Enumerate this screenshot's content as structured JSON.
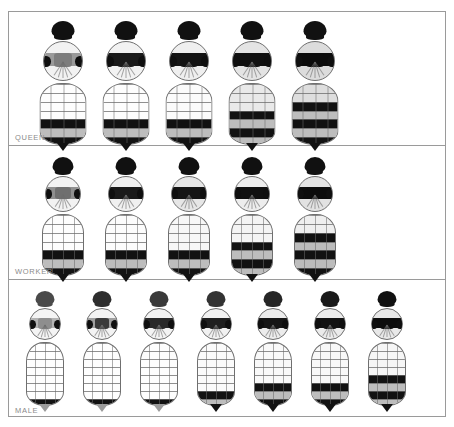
{
  "figure": {
    "panel_count": 3,
    "frame_color": "#9a9a9a",
    "background": "#ffffff"
  },
  "panels": [
    {
      "id": "queen-panel",
      "label": "QUEEN",
      "specimen_count": 5,
      "abdomen_form": "broad-ovate",
      "specimens": [
        {
          "index": 1,
          "head": "#111111",
          "thorax_base": "#f2f2f2",
          "thorax_band": "#9a9a9a",
          "scutellum": "#7d7d7d",
          "abdomen_tone": "#fdfdfd",
          "dark_bands": 3,
          "label": "queen-1"
        },
        {
          "index": 2,
          "head": "#111111",
          "thorax_base": "#f2f2f2",
          "thorax_band": "#1a1a1a",
          "scutellum": "#1a1a1a",
          "abdomen_tone": "#fdfdfd",
          "dark_bands": 3,
          "label": "queen-2"
        },
        {
          "index": 3,
          "head": "#111111",
          "thorax_base": "#efefef",
          "thorax_band": "#141414",
          "scutellum": "#141414",
          "abdomen_tone": "#fbfbfb",
          "dark_bands": 3,
          "label": "queen-3"
        },
        {
          "index": 4,
          "head": "#111111",
          "thorax_base": "#e4e4e4",
          "thorax_band": "#101010",
          "scutellum": "#101010",
          "abdomen_tone": "#e9e9e9",
          "dark_bands": 4,
          "label": "queen-4"
        },
        {
          "index": 5,
          "head": "#111111",
          "thorax_base": "#dcdcdc",
          "thorax_band": "#0c0c0c",
          "scutellum": "#0c0c0c",
          "abdomen_tone": "#dedede",
          "dark_bands": 5,
          "label": "queen-5"
        }
      ]
    },
    {
      "id": "worker-panel",
      "label": "WORKER",
      "specimen_count": 5,
      "abdomen_form": "narrow-elongate",
      "specimens": [
        {
          "index": 1,
          "head": "#111111",
          "thorax_base": "#f2f2f2",
          "thorax_band": "#8f8f8f",
          "scutellum": "#6f6f6f",
          "abdomen_tone": "#fdfdfd",
          "dark_bands": 3,
          "label": "worker-1"
        },
        {
          "index": 2,
          "head": "#111111",
          "thorax_base": "#f0f0f0",
          "thorax_band": "#1a1a1a",
          "scutellum": "#1a1a1a",
          "abdomen_tone": "#fcfcfc",
          "dark_bands": 3,
          "label": "worker-2"
        },
        {
          "index": 3,
          "head": "#111111",
          "thorax_base": "#e6e6e6",
          "thorax_band": "#151515",
          "scutellum": "#151515",
          "abdomen_tone": "#f7f7f7",
          "dark_bands": 3,
          "label": "worker-3"
        },
        {
          "index": 4,
          "head": "#111111",
          "thorax_base": "#ededed",
          "thorax_band": "#101010",
          "scutellum": "#101010",
          "abdomen_tone": "#f4f4f4",
          "dark_bands": 4,
          "label": "worker-4"
        },
        {
          "index": 5,
          "head": "#111111",
          "thorax_base": "#e2e2e2",
          "thorax_band": "#0c0c0c",
          "scutellum": "#0c0c0c",
          "abdomen_tone": "#efefef",
          "dark_bands": 5,
          "label": "worker-5"
        }
      ]
    },
    {
      "id": "male-panel",
      "label": "MALE",
      "specimen_count": 7,
      "abdomen_form": "slender-tapered",
      "specimens": [
        {
          "index": 1,
          "head": "#4a4a4a",
          "thorax_base": "#f4f4f4",
          "thorax_band": "#b4b4b4",
          "scutellum": "#8e8e8e",
          "abdomen_tone": "#fefefe",
          "dark_bands": 1,
          "label": "male-1"
        },
        {
          "index": 2,
          "head": "#2e2e2e",
          "thorax_base": "#f3f3f3",
          "thorax_band": "#a0a0a0",
          "scutellum": "#3a3a3a",
          "abdomen_tone": "#fefefe",
          "dark_bands": 1,
          "label": "male-2"
        },
        {
          "index": 3,
          "head": "#3a3a3a",
          "thorax_base": "#f3f3f3",
          "thorax_band": "#2a2a2a",
          "scutellum": "#2a2a2a",
          "abdomen_tone": "#fdfdfd",
          "dark_bands": 1,
          "label": "male-3"
        },
        {
          "index": 4,
          "head": "#333333",
          "thorax_base": "#f1f1f1",
          "thorax_band": "#1f1f1f",
          "scutellum": "#1f1f1f",
          "abdomen_tone": "#fbfbfb",
          "dark_bands": 2,
          "label": "male-4"
        },
        {
          "index": 5,
          "head": "#262626",
          "thorax_base": "#ececec",
          "thorax_band": "#161616",
          "scutellum": "#161616",
          "abdomen_tone": "#f9f9f9",
          "dark_bands": 3,
          "label": "male-5"
        },
        {
          "index": 6,
          "head": "#1a1a1a",
          "thorax_base": "#ebebeb",
          "thorax_band": "#121212",
          "scutellum": "#121212",
          "abdomen_tone": "#f8f8f8",
          "dark_bands": 3,
          "label": "male-6"
        },
        {
          "index": 7,
          "head": "#111111",
          "thorax_base": "#e8e8e8",
          "thorax_band": "#0d0d0d",
          "scutellum": "#0d0d0d",
          "abdomen_tone": "#f6f6f6",
          "dark_bands": 4,
          "label": "male-7"
        }
      ]
    }
  ]
}
